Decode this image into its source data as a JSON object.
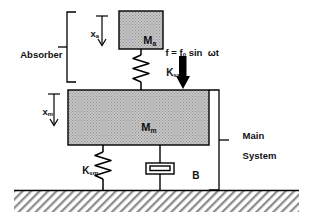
{
  "diagram": {
    "type": "free-body-schematic"
  },
  "labels": {
    "absorber": "Absorber",
    "main_system_line1": "Main",
    "main_system_line2": "System",
    "absorber_mass": "M",
    "absorber_mass_sub": "a",
    "main_mass": "M",
    "main_mass_sub": "m",
    "absorber_spring": "K",
    "absorber_spring_sub": "sa",
    "main_spring": "K",
    "main_spring_sub": "sm",
    "damper": "B",
    "disp_absorber": "x",
    "disp_absorber_sub": "a",
    "disp_main": "x",
    "disp_main_sub": "m",
    "force_expr": "f = f",
    "force_sub": "0",
    "force_expr_tail": " sin  ωt"
  },
  "icons": {
    "force_arrow": "downward-force-arrow-icon",
    "absorber_spring": "coil-spring-icon",
    "main_spring": "coil-spring-icon",
    "damper": "dashpot-damper-icon",
    "ground": "hatched-ground-icon",
    "disp_arrow_absorber": "down-displacement-arrow-icon",
    "disp_arrow_main": "down-displacement-arrow-icon",
    "bracket_absorber": "left-bracket-icon",
    "bracket_main": "right-bracket-icon"
  },
  "colors": {
    "stroke": "#000000",
    "mass_fill": "#b9b9b9",
    "ground_hatch": "#8a8a8a",
    "background": "#ffffff",
    "force_arrow": "#000000"
  },
  "geometry": {
    "canvas_width": 313,
    "canvas_height": 222,
    "absorber_mass_box": {
      "x": 119,
      "y": 11,
      "w": 44,
      "h": 38
    },
    "main_mass_box": {
      "x": 68,
      "y": 90,
      "w": 141,
      "h": 55
    },
    "ground_y": 190,
    "force_arrow_x": 183
  }
}
